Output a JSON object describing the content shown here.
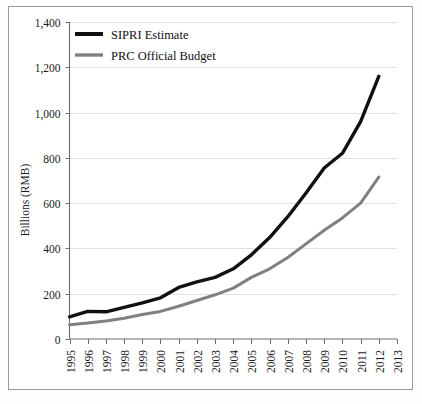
{
  "chart_data": {
    "type": "line",
    "title": "",
    "xlabel": "",
    "ylabel": "Billions (RMB)",
    "ylim": [
      0,
      1400
    ],
    "yticks": [
      "0",
      "200",
      "400",
      "600",
      "800",
      "1,000",
      "1,200",
      "1,400"
    ],
    "ytick_values": [
      0,
      200,
      400,
      600,
      800,
      1000,
      1200,
      1400
    ],
    "grid": true,
    "legend_position": "top-left",
    "categories": [
      "1995",
      "1996",
      "1997",
      "1998",
      "1999",
      "2000",
      "2001",
      "2002",
      "2003",
      "2004",
      "2005",
      "2006",
      "2007",
      "2008",
      "2009",
      "2010",
      "2011",
      "2012",
      "2013"
    ],
    "x": [
      1995,
      1996,
      1997,
      1998,
      1999,
      2000,
      2001,
      2002,
      2003,
      2004,
      2005,
      2006,
      2007,
      2008,
      2009,
      2010,
      2011,
      2012,
      2013
    ],
    "series": [
      {
        "name": "SIPRI Estimate",
        "color": "#111111",
        "values": [
          98,
          122,
          120,
          140,
          160,
          182,
          228,
          252,
          272,
          310,
          372,
          448,
          540,
          645,
          755,
          820,
          960,
          1160,
          null
        ]
      },
      {
        "name": "PRC Official Budget",
        "color": "#808080",
        "values": [
          63,
          70,
          80,
          92,
          108,
          122,
          145,
          170,
          195,
          225,
          272,
          310,
          360,
          420,
          480,
          535,
          600,
          715,
          null
        ]
      }
    ],
    "legend": [
      {
        "label": "SIPRI Estimate",
        "color": "#111111"
      },
      {
        "label": "PRC Official Budget",
        "color": "#808080"
      }
    ]
  },
  "axis": {
    "y_title": "Billions (RMB)"
  }
}
